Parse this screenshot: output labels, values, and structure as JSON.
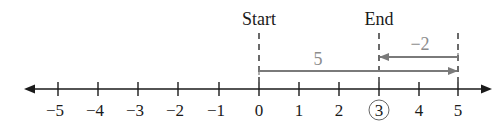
{
  "diagram": {
    "type": "number-line",
    "range": [
      -5,
      5
    ],
    "tick_labels": [
      "−5",
      "−4",
      "−3",
      "−2",
      "−1",
      "0",
      "1",
      "2",
      "3",
      "4",
      "5"
    ],
    "highlighted_value": "3",
    "start_label": "Start",
    "end_label": "End",
    "arrows": [
      {
        "from": 0,
        "to": 5,
        "label": "5"
      },
      {
        "from": 5,
        "to": 3,
        "label": "−2"
      }
    ],
    "colors": {
      "axis": "#1a1a1a",
      "vector": "#7a7a7a",
      "vector_label": "#8c8c8c"
    }
  }
}
